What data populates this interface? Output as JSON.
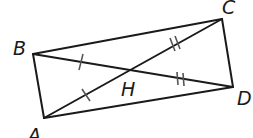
{
  "diagram": {
    "type": "geometry",
    "colors": {
      "stroke": "#1a1a1a",
      "background": "#ffffff"
    },
    "points": {
      "A": {
        "label": "A",
        "x": 44,
        "y": 118
      },
      "B": {
        "label": "B",
        "x": 33,
        "y": 54
      },
      "C": {
        "label": "C",
        "x": 222,
        "y": 19
      },
      "D": {
        "label": "D",
        "x": 233,
        "y": 87
      },
      "H": {
        "label": "H",
        "x": 128,
        "y": 70
      }
    },
    "segments": [
      "AB",
      "BC",
      "CD",
      "DA",
      "AC",
      "BD"
    ],
    "tick_marks": [
      {
        "segment": "HB",
        "count": 1
      },
      {
        "segment": "HA",
        "count": 1
      },
      {
        "segment": "HC",
        "count": 2
      },
      {
        "segment": "HD",
        "count": 2
      }
    ]
  }
}
